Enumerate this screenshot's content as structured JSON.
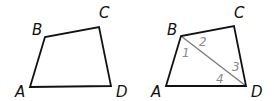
{
  "colors": {
    "edge": "#111111",
    "diagonal": "#7a7a7a",
    "angle_label": "#8a8a8a",
    "background": "#ffffff"
  },
  "figures": [
    {
      "name": "quadrilateral-abcd",
      "vertices": {
        "A": {
          "label": "A",
          "x": 30,
          "y": 87,
          "lx": 15,
          "ly": 97
        },
        "B": {
          "label": "B",
          "x": 45,
          "y": 37,
          "lx": 32,
          "ly": 35
        },
        "C": {
          "label": "C",
          "x": 99,
          "y": 27,
          "lx": 99,
          "ly": 18
        },
        "D": {
          "label": "D",
          "x": 111,
          "y": 86,
          "lx": 116,
          "ly": 97
        }
      }
    },
    {
      "name": "quadrilateral-abcd-with-diagonal-bd",
      "vertices": {
        "A": {
          "label": "A",
          "x": 166,
          "y": 86,
          "lx": 151,
          "ly": 97
        },
        "B": {
          "label": "B",
          "x": 181,
          "y": 36,
          "lx": 167,
          "ly": 35
        },
        "C": {
          "label": "C",
          "x": 234,
          "y": 26,
          "lx": 234,
          "ly": 18
        },
        "D": {
          "label": "D",
          "x": 246,
          "y": 86,
          "lx": 251,
          "ly": 97
        }
      },
      "diagonal": {
        "from": "B",
        "to": "D"
      },
      "angles": [
        {
          "label": "1",
          "x": 182,
          "y": 57
        },
        {
          "label": "2",
          "x": 199,
          "y": 46
        },
        {
          "label": "3",
          "x": 232,
          "y": 71
        },
        {
          "label": "4",
          "x": 216,
          "y": 83
        }
      ]
    }
  ]
}
